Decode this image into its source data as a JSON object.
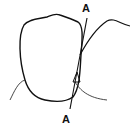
{
  "diagram": {
    "labels": {
      "top": "A",
      "bottom": "A"
    },
    "colors": {
      "line": "#111111",
      "gum_line": "#333333",
      "background": "#ffffff"
    }
  }
}
